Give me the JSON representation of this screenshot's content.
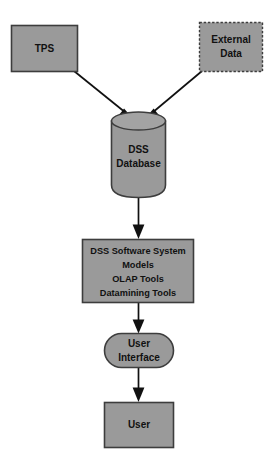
{
  "diagram": {
    "canvas": {
      "width": 274,
      "height": 454,
      "background": "#ffffff"
    },
    "palette": {
      "node_fill": "#9a9a9a",
      "node_border": "#3d3d3d",
      "arrow": "#111111",
      "label_text": "#111111"
    },
    "nodes": [
      {
        "id": "tps",
        "shape": "rectangle",
        "border_style": "solid",
        "lines": [
          "TPS"
        ]
      },
      {
        "id": "external-data",
        "shape": "rectangle",
        "border_style": "dashed",
        "lines": [
          "External",
          "Data"
        ]
      },
      {
        "id": "dss-database",
        "shape": "cylinder",
        "border_style": "solid",
        "lines": [
          "DSS",
          "Database"
        ]
      },
      {
        "id": "dss-software-system",
        "shape": "rectangle",
        "border_style": "solid",
        "lines": [
          "DSS Software System",
          "Models",
          "OLAP Tools",
          "Datamining Tools"
        ]
      },
      {
        "id": "user-interface",
        "shape": "stadium",
        "border_style": "solid",
        "lines": [
          "User",
          "Interface"
        ]
      },
      {
        "id": "user",
        "shape": "rectangle",
        "border_style": "solid",
        "lines": [
          "User"
        ]
      }
    ],
    "edges": [
      {
        "id": "tps-to-db",
        "from": "tps",
        "to": "dss-database",
        "style": "solid",
        "arrowhead": "filled-triangle"
      },
      {
        "id": "external-to-db",
        "from": "external-data",
        "to": "dss-database",
        "style": "solid",
        "arrowhead": "filled-triangle"
      },
      {
        "id": "db-to-software",
        "from": "dss-database",
        "to": "dss-software-system",
        "style": "solid",
        "arrowhead": "filled-triangle"
      },
      {
        "id": "software-to-ui",
        "from": "dss-software-system",
        "to": "user-interface",
        "style": "solid",
        "arrowhead": "filled-triangle"
      },
      {
        "id": "ui-to-user",
        "from": "user-interface",
        "to": "user",
        "style": "solid",
        "arrowhead": "filled-triangle"
      }
    ],
    "labels": {
      "tps": "TPS",
      "external_data_line1": "External",
      "external_data_line2": "Data",
      "dss_database_line1": "DSS",
      "dss_database_line2": "Database",
      "software_line1": "DSS Software System",
      "software_line2": "Models",
      "software_line3": "OLAP Tools",
      "software_line4": "Datamining Tools",
      "user_interface_line1": "User",
      "user_interface_line2": "Interface",
      "user": "User"
    }
  }
}
